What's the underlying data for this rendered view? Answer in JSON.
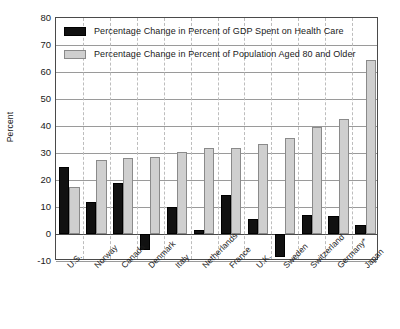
{
  "chart_data": {
    "type": "bar",
    "title": "",
    "subtitle": "",
    "xlabel": "",
    "ylabel": "Percent",
    "ylim": [
      -10,
      80
    ],
    "ytick_step": 10,
    "yticks": [
      80,
      70,
      60,
      50,
      40,
      30,
      20,
      10,
      0,
      -10
    ],
    "ytick_labels": [
      "80",
      "70",
      "60",
      "50",
      "40",
      "30",
      "20",
      "10",
      "0",
      "-10"
    ],
    "grid": "horizontal-solid-and-vertical-dashed",
    "legend_position": "top-left-inside",
    "categories": [
      "U.S.",
      "Norway",
      "Canada",
      "Denmark",
      "Italy",
      "Netherlands",
      "France",
      "U.K.",
      "Sweden",
      "Switzerland",
      "Germany*",
      "Japan"
    ],
    "series": [
      {
        "name": "Percentage Change in Percent of GDP Spent on Health Care",
        "color": "#111111",
        "values": [
          25,
          12,
          19,
          -6,
          10,
          1.5,
          14.5,
          5.5,
          -8.5,
          7,
          6.5,
          3.5
        ]
      },
      {
        "name": "Percentage Change in Percent of Population Aged 80 and Older",
        "color": "#cfcfcf",
        "values": [
          17.5,
          27.5,
          28,
          28.5,
          30.5,
          32,
          32,
          33.5,
          35.5,
          39.5,
          42.5,
          64.5
        ]
      }
    ],
    "annotations": []
  },
  "legend": {
    "items": [
      {
        "label": "Percentage Change in Percent of GDP Spent on Health Care",
        "swatch": "black"
      },
      {
        "label": "Percentage Change in Percent of Population Aged 80 and Older",
        "swatch": "gray"
      }
    ]
  }
}
